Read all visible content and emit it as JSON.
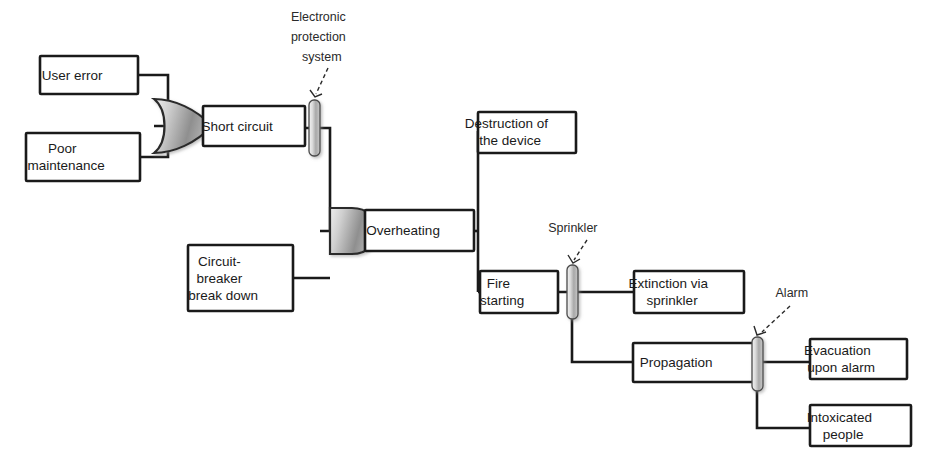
{
  "diagram": {
    "type": "fault-tree-bowtie",
    "colors": {
      "background": "#ffffff",
      "box_stroke": "#1a1a1a",
      "box_fill": "#ffffff",
      "connector": "#1a1a1a",
      "barrier_fill_light": "#e2e2e2",
      "barrier_fill_dark": "#9a9a9a",
      "gate_fill_light": "#d8d8d8",
      "gate_fill_dark": "#8d8d8d",
      "text": "#1a1a1a"
    },
    "nodes": [
      {
        "id": "user-error",
        "label": "User error",
        "lines": [
          "User error"
        ],
        "x": 40,
        "y": 56,
        "w": 98,
        "h": 38
      },
      {
        "id": "poor-maintenance",
        "label": "Poor maintenance",
        "lines": [
          "Poor",
          "maintenance"
        ],
        "x": 26,
        "y": 133,
        "w": 114,
        "h": 48
      },
      {
        "id": "short-circuit",
        "label": "Short circuit",
        "lines": [
          "Short circuit"
        ],
        "x": 203,
        "y": 106,
        "w": 102,
        "h": 40
      },
      {
        "id": "circuit-breaker",
        "label": "Circuit-breaker break down",
        "lines": [
          "Circuit-",
          "breaker",
          "break down"
        ],
        "x": 188,
        "y": 245,
        "w": 105,
        "h": 66
      },
      {
        "id": "overheating",
        "label": "Overheating",
        "lines": [
          "Overheating"
        ],
        "x": 365,
        "y": 210,
        "w": 109,
        "h": 41
      },
      {
        "id": "destruction-device",
        "label": "Destruction of the device",
        "lines": [
          "Destruction of",
          "the device"
        ],
        "x": 478,
        "y": 112,
        "w": 98,
        "h": 41
      },
      {
        "id": "fire-starting",
        "label": "Fire starting",
        "lines": [
          "Fire",
          "starting"
        ],
        "x": 480,
        "y": 271,
        "w": 78,
        "h": 42
      },
      {
        "id": "extinction-sprinkler",
        "label": "Extinction via sprinkler",
        "lines": [
          "Extinction via",
          "sprinkler"
        ],
        "x": 634,
        "y": 271,
        "w": 110,
        "h": 42
      },
      {
        "id": "propagation",
        "label": "Propagation",
        "lines": [
          "Propagation"
        ],
        "x": 633,
        "y": 343,
        "w": 121,
        "h": 39
      },
      {
        "id": "evacuation-alarm",
        "label": "Evacuation upon alarm",
        "lines": [
          "Evacuation",
          "upon alarm"
        ],
        "x": 810,
        "y": 339,
        "w": 97,
        "h": 40
      },
      {
        "id": "intoxicated-people",
        "label": "Intoxicated people",
        "lines": [
          "Intoxicated",
          "people"
        ],
        "x": 810,
        "y": 405,
        "w": 101,
        "h": 41
      }
    ],
    "gates": [
      {
        "id": "or-gate-short-circuit",
        "type": "OR",
        "cx": 183,
        "cy": 126,
        "rw": 30,
        "rh": 34
      },
      {
        "id": "and-gate-overheating",
        "type": "AND",
        "cx": 348,
        "cy": 231,
        "rw": 28,
        "rh": 32
      }
    ],
    "barriers": [
      {
        "id": "electronic-protection-system",
        "label": "Electronic protection system",
        "label_lines": [
          "Electronic",
          "protection",
          "system"
        ],
        "x": 309,
        "y": 100,
        "w": 11,
        "h": 56,
        "label_x": 334,
        "label_y": 18
      },
      {
        "id": "sprinkler",
        "label": "Sprinkler",
        "label_lines": [
          "Sprinkler"
        ],
        "x": 567,
        "y": 265,
        "w": 11,
        "h": 54,
        "label_x": 585,
        "label_y": 229
      },
      {
        "id": "alarm",
        "label": "Alarm",
        "label_lines": [
          "Alarm"
        ],
        "x": 752,
        "y": 337,
        "w": 11,
        "h": 54,
        "label_x": 804,
        "label_y": 294
      }
    ],
    "connections": [
      {
        "id": "user-error-to-or",
        "from": "user-error",
        "to": "or-gate-short-circuit"
      },
      {
        "id": "poor-maintenance-to-or",
        "from": "poor-maintenance",
        "to": "or-gate-short-circuit"
      },
      {
        "id": "or-to-short-circuit",
        "from": "or-gate-short-circuit",
        "to": "short-circuit"
      },
      {
        "id": "short-circuit-to-and",
        "from": "short-circuit",
        "to": "and-gate-overheating",
        "through_barrier": "electronic-protection-system"
      },
      {
        "id": "circuit-breaker-to-and",
        "from": "circuit-breaker",
        "to": "and-gate-overheating"
      },
      {
        "id": "and-to-overheating",
        "from": "and-gate-overheating",
        "to": "overheating"
      },
      {
        "id": "overheating-to-destruction",
        "from": "overheating",
        "to": "destruction-device"
      },
      {
        "id": "overheating-to-fire",
        "from": "overheating",
        "to": "fire-starting"
      },
      {
        "id": "fire-to-extinction",
        "from": "fire-starting",
        "to": "extinction-sprinkler",
        "through_barrier": "sprinkler"
      },
      {
        "id": "fire-to-propagation",
        "from": "fire-starting",
        "to": "propagation",
        "through_barrier": "sprinkler"
      },
      {
        "id": "propagation-to-evacuation",
        "from": "propagation",
        "to": "evacuation-alarm",
        "through_barrier": "alarm"
      },
      {
        "id": "propagation-to-intoxicated",
        "from": "propagation",
        "to": "intoxicated-people",
        "through_barrier": "alarm"
      }
    ]
  }
}
